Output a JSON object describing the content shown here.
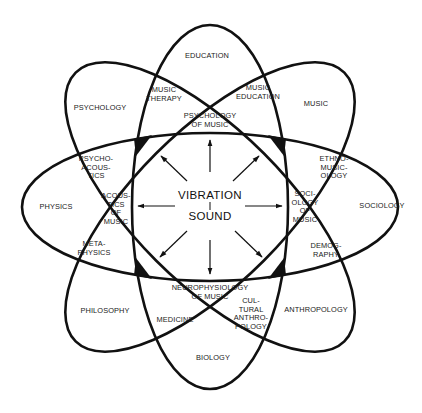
{
  "diagram": {
    "title": "",
    "center": {
      "top_label": "VIBRATION",
      "bottom_label": "SOUND"
    },
    "disciplines": {
      "education": "EDUCATION",
      "music": "MUSIC",
      "sociology": "SOCIOLOGY",
      "anthropology": "ANTHROPOLOGY",
      "biology": "BIOLOGY",
      "philosophy": "PHILOSOPHY",
      "physics": "PHYSICS",
      "psychology": "PSYCHOLOGY"
    },
    "intersections": {
      "music_therapy": "MUSIC\nTHERAPY",
      "music_education": "MUSIC\nEDUCATION",
      "psychology_of_music": "PSYCHOLOGY\nOF MUSIC",
      "ethnomusicology": "ETHNO-\nMUSIC-\nOLOGY",
      "sociology_of_music": "SOCI-\nOLOGY\nOF\nMUSIC",
      "demography": "DEMOG-\nRAPHY",
      "cultural_anthropology": "CUL-\nTURAL\nANTHRO-\nPOLOGY",
      "neurophysiology_of_music": "NEUROPHYSIOLOGY\nOF MUSIC",
      "medicine": "MEDICINE",
      "metaphysics": "META-\nPHYSICS",
      "acoustics_of_music": "ACOUS-\nTICS\nOF\nMUSIC",
      "psychoacoustics": "PSYCHO-\nACOUS-\nTICS"
    },
    "geometry": {
      "center": [
        210,
        207
      ],
      "ellipses": [
        {
          "name": "horizontal",
          "rx": 188,
          "ry": 74,
          "rotation": 0
        },
        {
          "name": "vertical",
          "rx": 78,
          "ry": 182,
          "rotation": 0
        },
        {
          "name": "diagonal-psychology-anthropology",
          "rx": 190,
          "ry": 76,
          "rotation": 45
        },
        {
          "name": "diagonal-music-philosophy",
          "rx": 190,
          "ry": 76,
          "rotation": -45
        }
      ],
      "arrow_count": 8
    },
    "colors": {
      "stroke": "#111111",
      "background": "#ffffff"
    }
  }
}
